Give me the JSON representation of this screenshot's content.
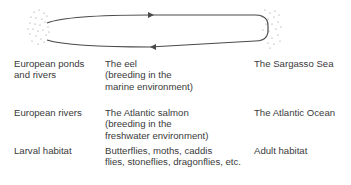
{
  "diagram": {
    "type": "migration-cycle",
    "colors": {
      "line": "#4a4a4a",
      "text": "#3a3a3a",
      "dots": "#8a8a8a"
    },
    "rows": [
      {
        "left": "European ponds\nand rivers",
        "middle": "The eel\n(breeding in the\nmarine environment)",
        "right": "The Sargasso Sea"
      },
      {
        "left": "European rivers",
        "middle": "The Atlantic salmon\n(breeding in the\nfreshwater environment)",
        "right": "The Atlantic Ocean"
      },
      {
        "left": "Larval habitat",
        "middle": "Butterflies, moths, caddis\nflies, stoneflies, dragonflies, etc.",
        "right": "Adult habitat"
      }
    ]
  }
}
